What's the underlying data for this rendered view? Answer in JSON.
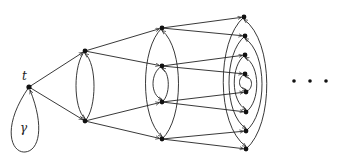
{
  "diagram": {
    "type": "directed-graph",
    "colors": {
      "edge": "#222222",
      "node": "#111111",
      "background": "#ffffff"
    },
    "labels": {
      "root": "t",
      "loop": "γ",
      "continuation": "..."
    },
    "nodes": {
      "root": [
        29,
        87
      ],
      "layer1": [
        [
          85,
          51
        ],
        [
          85,
          121
        ]
      ],
      "layer2": [
        [
          162,
          28
        ],
        [
          162,
          66
        ],
        [
          162,
          102
        ],
        [
          162,
          139
        ]
      ],
      "layer3": [
        [
          244,
          17
        ],
        [
          245,
          36
        ],
        [
          245,
          55
        ],
        [
          245,
          74
        ],
        [
          246,
          92
        ],
        [
          246,
          112
        ],
        [
          246,
          131
        ],
        [
          246,
          149
        ]
      ]
    },
    "ellipsis_dots": [
      [
        294,
        81
      ],
      [
        310,
        81
      ],
      [
        326,
        81
      ]
    ]
  }
}
